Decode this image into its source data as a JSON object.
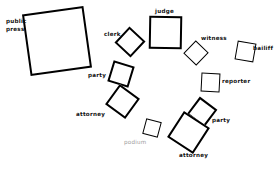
{
  "diagram": {
    "background_color": "#ffffff",
    "stroke_color": "#000000",
    "label_color": "#111111",
    "muted_label_color": "#9a9a9a",
    "width": 280,
    "height": 169,
    "labels": {
      "public_press_line1": "public",
      "public_press_line2": "press",
      "clerk": "clerk",
      "judge": "judge",
      "witness": "witness",
      "bailiff": "bailiff",
      "reporter": "reporter",
      "party_left": "party",
      "attorney_left": "attorney",
      "podium": "podium",
      "party_right": "party",
      "attorney_right": "attorney"
    },
    "nodes": [
      {
        "name": "public-press",
        "label": "public press",
        "x": 26,
        "y": 10,
        "size": 62,
        "rotation": -8
      },
      {
        "name": "clerk",
        "label": "clerk",
        "x": 118,
        "y": 30,
        "size": 22,
        "rotation": 43
      },
      {
        "name": "judge",
        "label": "judge",
        "x": 149,
        "y": 15,
        "size": 33,
        "rotation": 1
      },
      {
        "name": "witness",
        "label": "witness",
        "x": 187,
        "y": 43,
        "size": 18,
        "rotation": 44
      },
      {
        "name": "bailiff",
        "label": "bailiff",
        "x": 235,
        "y": 41,
        "size": 19,
        "rotation": 10
      },
      {
        "name": "reporter",
        "label": "reporter",
        "x": 201,
        "y": 72,
        "size": 19,
        "rotation": 3
      },
      {
        "name": "party-left",
        "label": "party",
        "x": 109,
        "y": 62,
        "size": 22,
        "rotation": 17
      },
      {
        "name": "attorney-left",
        "label": "attorney",
        "x": 109,
        "y": 88,
        "size": 25,
        "rotation": 36
      },
      {
        "name": "podium",
        "label": "podium",
        "x": 144,
        "y": 120,
        "size": 16,
        "rotation": 15
      },
      {
        "name": "party-right",
        "label": "party",
        "x": 191,
        "y": 100,
        "size": 22,
        "rotation": 37
      },
      {
        "name": "attorney-right",
        "label": "attorney",
        "x": 172,
        "y": 116,
        "size": 31,
        "rotation": 33
      }
    ]
  }
}
